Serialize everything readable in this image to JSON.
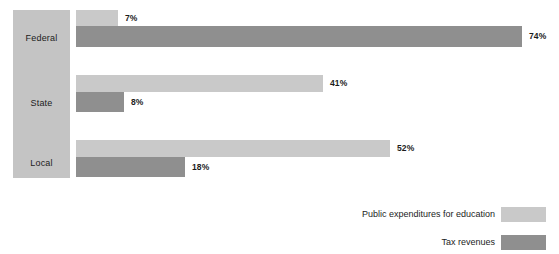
{
  "chart_data": {
    "type": "bar",
    "title": "",
    "subtitle": "",
    "xlabel": "",
    "ylabel": "",
    "orientation": "horizontal",
    "grouped": true,
    "grid": false,
    "xlim": [
      0,
      80
    ],
    "legend_position": "bottom-right",
    "value_suffix": "%",
    "categories": [
      "Federal",
      "State",
      "Local"
    ],
    "series": [
      {
        "name": "Public expenditures for education",
        "color": "#c9c9c9",
        "values": [
          7,
          41,
          52
        ],
        "labels": [
          "7%",
          "41%",
          "52%"
        ]
      },
      {
        "name": "Tax revenues",
        "color": "#8f8f8f",
        "values": [
          74,
          8,
          18
        ],
        "labels": [
          "74%",
          "8%",
          "18%"
        ]
      }
    ]
  },
  "axis": {
    "category_box_color": "#c4c4c4",
    "categories": [
      {
        "label": "Federal"
      },
      {
        "label": "State"
      },
      {
        "label": "Local"
      }
    ]
  },
  "legend": {
    "entries": [
      {
        "label": "Public expenditures for education",
        "color": "#c9c9c9"
      },
      {
        "label": "Tax revenues",
        "color": "#8f8f8f"
      }
    ]
  },
  "values": {
    "federal_light": "7%",
    "federal_dark": "74%",
    "state_light": "41%",
    "state_dark": "8%",
    "local_light": "52%",
    "local_dark": "18%"
  }
}
